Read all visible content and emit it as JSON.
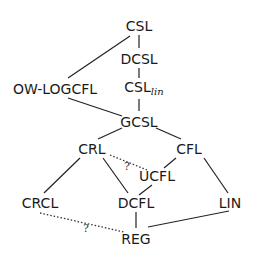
{
  "nodes": {
    "csl": {
      "label": "CSL",
      "x": 139,
      "y": 26
    },
    "dcsl": {
      "label": "DCSL",
      "x": 139,
      "y": 59
    },
    "csl_lin": {
      "label": "CSL",
      "sub": "lin",
      "x": 139,
      "y": 89
    },
    "ow_logcfl": {
      "label": "OW-LOGCFL",
      "x": 55,
      "y": 89
    },
    "gcsl": {
      "label": "GCSL",
      "x": 139,
      "y": 122
    },
    "crl": {
      "label": "CRL",
      "x": 92,
      "y": 150
    },
    "cfl": {
      "label": "CFL",
      "x": 185,
      "y": 150
    },
    "ucfl": {
      "label": "UCFL",
      "x": 157,
      "y": 176
    },
    "crcl": {
      "label": "CRCL",
      "x": 40,
      "y": 203
    },
    "dcfl": {
      "label": "DCFL",
      "x": 136,
      "y": 203
    },
    "lin": {
      "label": "LIN",
      "x": 230,
      "y": 203
    },
    "reg": {
      "label": "REG",
      "x": 136,
      "y": 239
    }
  },
  "edges": [
    {
      "from": "csl",
      "to": "dcsl",
      "style": "solid"
    },
    {
      "from": "csl",
      "to": "ow_logcfl",
      "style": "solid"
    },
    {
      "from": "dcsl",
      "to": "csl_lin",
      "style": "solid"
    },
    {
      "from": "csl_lin",
      "to": "gcsl",
      "style": "solid"
    },
    {
      "from": "ow_logcfl",
      "to": "gcsl",
      "style": "solid"
    },
    {
      "from": "gcsl",
      "to": "crl",
      "style": "solid"
    },
    {
      "from": "gcsl",
      "to": "cfl",
      "style": "solid"
    },
    {
      "from": "crl",
      "to": "crcl",
      "style": "solid"
    },
    {
      "from": "crl",
      "to": "dcfl",
      "style": "solid"
    },
    {
      "from": "crl",
      "to": "ucfl",
      "style": "dotted",
      "label": "?"
    },
    {
      "from": "cfl",
      "to": "ucfl",
      "style": "solid"
    },
    {
      "from": "cfl",
      "to": "lin",
      "style": "solid"
    },
    {
      "from": "ucfl",
      "to": "dcfl",
      "style": "solid"
    },
    {
      "from": "dcfl",
      "to": "reg",
      "style": "solid"
    },
    {
      "from": "lin",
      "to": "reg",
      "style": "solid"
    },
    {
      "from": "crcl",
      "to": "reg",
      "style": "dotted",
      "label": "?"
    }
  ],
  "question_marks": [
    {
      "label": "?",
      "x": 127,
      "y": 166
    },
    {
      "label": "?",
      "x": 86,
      "y": 228
    }
  ]
}
